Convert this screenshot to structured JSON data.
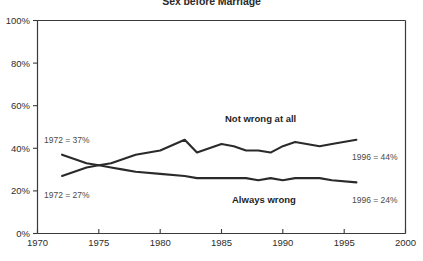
{
  "chart_data": {
    "type": "line",
    "title": "Sex before Marriage",
    "xlabel": "",
    "ylabel": "",
    "xlim": [
      1970,
      2000
    ],
    "ylim": [
      0,
      100
    ],
    "grid": false,
    "legend_position": "inline-labels",
    "x_ticks": [
      "1970",
      "1975",
      "1980",
      "1985",
      "1990",
      "1995",
      "2000"
    ],
    "y_ticks": [
      "0%",
      "20%",
      "40%",
      "60%",
      "80%",
      "100%"
    ],
    "x": [
      1972,
      1973,
      1974,
      1975,
      1976,
      1977,
      1978,
      1980,
      1982,
      1983,
      1984,
      1985,
      1986,
      1987,
      1988,
      1989,
      1990,
      1991,
      1993,
      1994,
      1996
    ],
    "series": [
      {
        "name": "Not wrong at all",
        "label": "Not wrong at all",
        "values": [
          27,
          29,
          31,
          32,
          33,
          35,
          37,
          39,
          44,
          38,
          40,
          42,
          41,
          39,
          39,
          38,
          41,
          43,
          41,
          42,
          44
        ],
        "start_note": "1972 = 27%",
        "end_note": "1996 = 44%"
      },
      {
        "name": "Always wrong",
        "label": "Always wrong",
        "values": [
          37,
          35,
          33,
          32,
          31,
          30,
          29,
          28,
          27,
          26,
          26,
          26,
          26,
          26,
          25,
          26,
          25,
          26,
          26,
          25,
          24
        ],
        "start_note": "1972 = 37%",
        "end_note": "1996 = 24%"
      }
    ],
    "annotations": [
      {
        "id": "left-top",
        "text": "1972 = 37%"
      },
      {
        "id": "left-bottom",
        "text": "1972 = 27%"
      },
      {
        "id": "right-top",
        "text": "1996 = 44%"
      },
      {
        "id": "right-bottom",
        "text": "1996 = 24%"
      },
      {
        "id": "series-upper",
        "text": "Not wrong at all"
      },
      {
        "id": "series-lower",
        "text": "Always wrong"
      }
    ],
    "colors": {
      "line": "#2a2a2a",
      "axis": "#3a3a3a",
      "text": "#2e2e2e",
      "background": "#ffffff"
    }
  }
}
